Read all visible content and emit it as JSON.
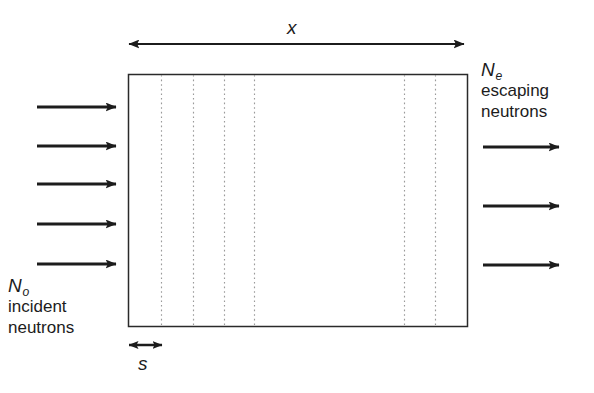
{
  "figure": {
    "type": "schematic-diagram",
    "width": 594,
    "height": 393,
    "background_color": "#ffffff",
    "line_color": "#1c1c1c",
    "dotted_line_color": "#9a9a9a"
  },
  "slab": {
    "name": "absorber-slab",
    "x": 128,
    "y": 74,
    "width": 340,
    "height": 253,
    "border_color": "#2a2a2a",
    "fill_color": "#ffffff",
    "slice_lines_x": [
      161,
      193,
      224,
      254,
      404,
      435
    ]
  },
  "dimensions": {
    "thickness": {
      "symbol": "x",
      "subscript": "",
      "label_x": 296,
      "label_y": 28,
      "arrow_from_x": 128,
      "arrow_to_x": 465,
      "arrow_y": 44,
      "style": "double-headed"
    },
    "slice": {
      "symbol": "s",
      "subscript": "",
      "label_x": 144,
      "label_y": 360,
      "arrow_from_x": 128,
      "arrow_to_x": 163,
      "arrow_y": 345,
      "style": "double-headed"
    }
  },
  "incident": {
    "symbol": "N",
    "subscript": "o",
    "line1": "incident",
    "line2": "neutrons",
    "arrow_count": 5,
    "arrow_from_x": 37,
    "arrow_to_x": 119,
    "arrow_y": [
      107,
      146,
      184,
      224,
      264
    ]
  },
  "escaping": {
    "symbol": "N",
    "subscript": "e",
    "line1": "escaping",
    "line2": "neutrons",
    "arrow_count": 3,
    "arrow_from_x": 483,
    "arrow_to_x": 562,
    "arrow_y": [
      147,
      206,
      265
    ]
  }
}
